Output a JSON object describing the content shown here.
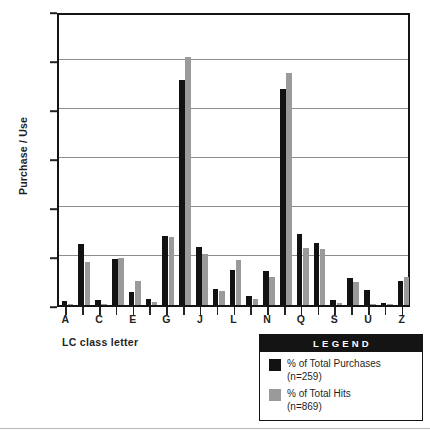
{
  "chart_data": {
    "type": "bar",
    "title": "",
    "subtitle": "",
    "xlabel": "LC class letter",
    "ylabel": "Purchase / Use",
    "grid": true,
    "legend_position": "bottom-right",
    "ylim": [
      0,
      30
    ],
    "ytick_labels": [
      "0%",
      "5%",
      "10%",
      "15%",
      "20%",
      "25%",
      "30%"
    ],
    "ytick_values": [
      0,
      5,
      10,
      15,
      20,
      25,
      30
    ],
    "categories": [
      "A",
      "B",
      "C",
      "D",
      "E",
      "F",
      "G",
      "H",
      "J",
      "K",
      "L",
      "M",
      "N",
      "P",
      "Q",
      "R",
      "S",
      "T",
      "U",
      "V",
      "Z"
    ],
    "xtick_labels_shown": [
      "A",
      "C",
      "E",
      "G",
      "J",
      "L",
      "N",
      "Q",
      "S",
      "U",
      "Z"
    ],
    "series": [
      {
        "name": "% of Total Purchases",
        "note": "(n=259)",
        "color": "#121212",
        "values": [
          0.4,
          6.2,
          0.5,
          4.7,
          1.3,
          0.6,
          7.0,
          23.0,
          5.9,
          1.6,
          3.6,
          0.9,
          3.5,
          22.0,
          7.2,
          6.3,
          0.5,
          2.8,
          1.5,
          0.2,
          2.4
        ]
      },
      {
        "name": "% of Total Hits",
        "note": "(n=869)",
        "color": "#9a9a9a",
        "values": [
          0.1,
          4.4,
          0.1,
          4.8,
          2.5,
          0.3,
          6.9,
          25.3,
          5.2,
          1.4,
          4.6,
          0.6,
          2.9,
          23.7,
          5.8,
          5.7,
          0.2,
          2.3,
          0.1,
          0.0,
          2.9
        ]
      }
    ]
  },
  "legend": {
    "title": "LEGEND",
    "entries": [
      {
        "label": "% of Total Purchases",
        "sub": "(n=259)",
        "swatch": "purchases"
      },
      {
        "label": "% of Total Hits",
        "sub": "(n=869)",
        "swatch": "hits"
      }
    ]
  },
  "axes": {
    "y_title": "Purchase / Use",
    "x_title": "LC class letter"
  }
}
